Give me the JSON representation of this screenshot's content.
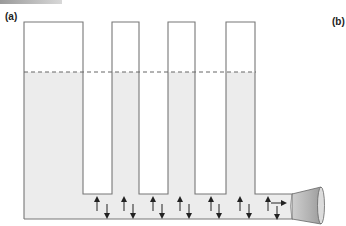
{
  "panels": {
    "a": {
      "label": "(a)"
    },
    "b": {
      "label": "(b)"
    }
  },
  "colors": {
    "fluid": "#ececec",
    "outline": "#777777",
    "dashed_level": "#666666",
    "arrow": "#222222",
    "funnel_fill": "#bdbdbd",
    "funnel_rim": "#dcdcdc"
  },
  "diagram": {
    "reservoir": {
      "x": 24,
      "y": 22,
      "width": 59
    },
    "tubes": [
      {
        "x": 112,
        "width": 27
      },
      {
        "x": 168,
        "width": 27
      },
      {
        "x": 226,
        "width": 29
      }
    ],
    "tube_top_y": 22,
    "tube_bottom_y": 194,
    "fluid_level_y": 72,
    "channel_floor_y": 219,
    "channel_top_right_y": 194,
    "up_arrows_x": [
      97,
      124,
      153,
      180,
      211,
      240,
      268
    ],
    "down_arrows_x": [
      107,
      133,
      162,
      189,
      219,
      249,
      277
    ],
    "flow_arrow": {
      "x1": 272,
      "x2": 284,
      "y": 203
    },
    "outlet": "funnel-nozzle"
  }
}
